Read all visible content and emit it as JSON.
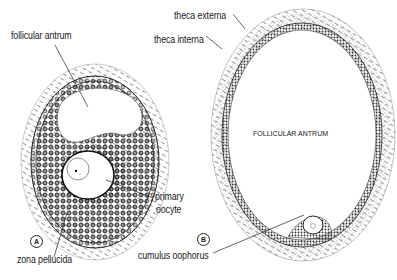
{
  "figure": {
    "panels": [
      {
        "id": "A",
        "tag": "A",
        "labels": {
          "follicular_antrum": "follicular antrum",
          "primary_oocyte": [
            "primary",
            "oocyte"
          ],
          "zona_pellucida": "zona pellucida"
        }
      },
      {
        "id": "B",
        "tag": "B",
        "labels": {
          "theca_externa": "theca externa",
          "theca_interna": "theca interna",
          "follicular_antrum": "FOLLICULAR ANTRUM",
          "cumulus_oophorus": "cumulus oophorus"
        }
      }
    ],
    "colors": {
      "ink": "#1a1a1a",
      "background": "#ffffff"
    }
  }
}
